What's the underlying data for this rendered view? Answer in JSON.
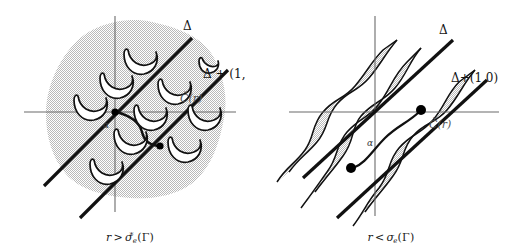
{
  "figure": {
    "title": "",
    "background_color": "#ffffff",
    "panel_count": 2
  },
  "colors": {
    "line_dark": "#111111",
    "axis_gray": "#6b6b6b",
    "shade_gray": "#d8d8d8",
    "shade_gray_right": "#d4d4d4",
    "outline": "#111111",
    "dot": "#000000",
    "text": "#141414"
  },
  "panels": [
    {
      "id": "left",
      "name": "panel-r-greater",
      "caption": {
        "variable": "r",
        "relation": ">",
        "sigma": "σ",
        "sigma_sub": "e",
        "sigma_star": "*",
        "argument": "(Γ)",
        "full": "r > σ*ₑ(Γ)"
      },
      "labels": {
        "delta": "Δ",
        "delta_shift": "Δ + (1,",
        "delta_shift_full": "Δ + (1,0)",
        "c_check": "Č(r)",
        "alpha": "α"
      },
      "axes": {
        "x_axis": "horizontal-axis",
        "y_axis": "vertical-axis",
        "origin_label": "α"
      },
      "features": {
        "region_type": "single-connected-shaded-blob",
        "crescent_count": 11,
        "dot_count": 2,
        "line_count": 2,
        "connector_curve": true
      }
    },
    {
      "id": "right",
      "name": "panel-r-less",
      "caption": {
        "variable": "r",
        "relation": "<",
        "sigma": "σ",
        "sigma_sub": "e",
        "sigma_star": "",
        "argument": "(Γ)",
        "full": "r < σₑ(Γ)"
      },
      "labels": {
        "delta": "Δ",
        "delta_shift": "Δ+(1,0)",
        "delta_shift_full": "Δ+(1,0)",
        "c_check": "Č(r)",
        "alpha": "α"
      },
      "axes": {
        "x_axis": "horizontal-axis",
        "y_axis": "vertical-axis",
        "origin_label": "α"
      },
      "features": {
        "region_type": "two-wavy-diagonal-bands",
        "band_count": 2,
        "dot_count": 2,
        "line_count": 2,
        "connector_curve": true
      }
    }
  ]
}
